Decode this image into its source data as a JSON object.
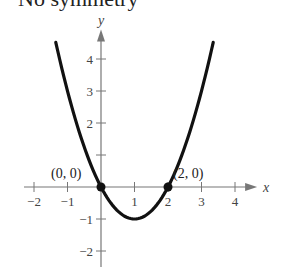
{
  "caption": "No symmetry",
  "chart_data": {
    "type": "line",
    "title": "No symmetry",
    "function": "y = x^2 - 2x",
    "xlabel": "x",
    "ylabel": "y",
    "xlim": [
      -2.3,
      4.6
    ],
    "ylim": [
      -2.5,
      4.8
    ],
    "x_ticks": [
      -2,
      -1,
      1,
      2,
      3,
      4
    ],
    "x_tick_labels": [
      "−2",
      "−1",
      "1",
      "2",
      "3",
      "4"
    ],
    "y_ticks": [
      -2,
      -1,
      1,
      2,
      3,
      4
    ],
    "y_tick_labels": [
      "−2",
      "−1",
      "",
      "2",
      "3",
      "4"
    ],
    "grid": false,
    "series": [
      {
        "name": "parabola",
        "x": [
          -1.35,
          -1,
          -0.5,
          0,
          0.5,
          1,
          1.5,
          2,
          2.5,
          3,
          3.35
        ],
        "y": [
          4.52,
          3,
          1.25,
          0,
          -0.75,
          -1,
          -0.75,
          0,
          1.25,
          3,
          4.52
        ]
      }
    ],
    "annotations": [
      {
        "label": "(0, 0)",
        "x": 0,
        "y": 0
      },
      {
        "label": "(2, 0)",
        "x": 2,
        "y": 0
      }
    ]
  }
}
